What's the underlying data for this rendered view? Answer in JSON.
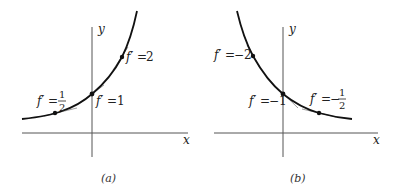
{
  "panels": [
    {
      "id": "a",
      "caption": "(a)",
      "x_label": "x",
      "y_label": "y",
      "curve": "increasing exponential",
      "annotations": [
        {
          "label": "f′ = ",
          "value": "1/2",
          "num": "1",
          "den": "2"
        },
        {
          "label": "f′ = ",
          "value": "1"
        },
        {
          "label": "f′ = ",
          "value": "2"
        }
      ]
    },
    {
      "id": "b",
      "caption": "(b)",
      "x_label": "x",
      "y_label": "y",
      "curve": "decreasing exponential",
      "annotations": [
        {
          "label": "f′ = ",
          "value": "−2"
        },
        {
          "label": "f′ = ",
          "value": "−1"
        },
        {
          "label": "f′ = ",
          "value": "−1/2",
          "sign": "−",
          "num": "1",
          "den": "2"
        }
      ]
    }
  ],
  "colors": {
    "curve": "#111111",
    "axis": "#555555",
    "tangent": "#777777"
  }
}
